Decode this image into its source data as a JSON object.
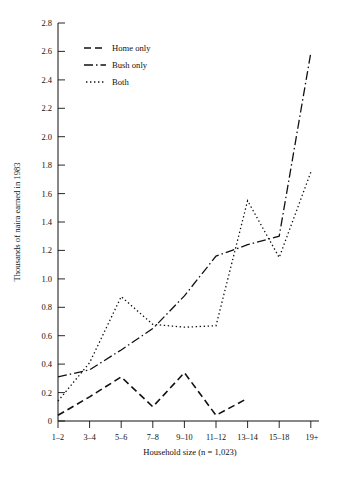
{
  "chart_data": {
    "type": "line",
    "title": "",
    "xlabel": "Household size (n = 1,023)",
    "ylabel": "Thousands of naira earned in 1983",
    "categories": [
      "1–2",
      "3–4",
      "5–6",
      "7–8",
      "9–10",
      "11–12",
      "13–14",
      "15–18",
      "19+"
    ],
    "ylim": [
      0,
      2.8
    ],
    "yticks": [
      "0",
      "0.2",
      "0.4",
      "0.6",
      "0.8",
      "1.0",
      "1.2",
      "1.4",
      "1.6",
      "1.8",
      "2.0",
      "2.2",
      "2.4",
      "2.6",
      "2.8"
    ],
    "ytick_values": [
      0,
      0.2,
      0.4,
      0.6,
      0.8,
      1.0,
      1.2,
      1.4,
      1.6,
      1.8,
      2.0,
      2.2,
      2.4,
      2.6,
      2.8
    ],
    "grid": false,
    "legend_position": "top-left-inside",
    "series": [
      {
        "name": "Home only",
        "style": "dashed",
        "dash": "7,4",
        "width": 1.6,
        "color": "#111111",
        "values": [
          0.04,
          0.17,
          0.31,
          0.1,
          0.34,
          0.04,
          0.16,
          null,
          null
        ]
      },
      {
        "name": "Bush only",
        "style": "dash-dot",
        "dash": "9,3,1.5,3",
        "width": 1.3,
        "color": "#111111",
        "values": [
          0.31,
          0.36,
          0.5,
          0.65,
          0.88,
          1.16,
          1.24,
          1.3,
          2.59
        ]
      },
      {
        "name": "Both",
        "style": "dotted",
        "dash": "1.4,2.6",
        "width": 1.3,
        "color": "#111111",
        "values": [
          0.14,
          0.41,
          0.875,
          0.68,
          0.66,
          0.67,
          1.55,
          1.15,
          1.75
        ]
      }
    ]
  },
  "legend": {
    "items": [
      {
        "label": "Home only"
      },
      {
        "label": "Bush only"
      },
      {
        "label": "Both"
      }
    ]
  },
  "axes": {
    "y_title": "Thousands of naira earned in 1983",
    "x_title": "Household size (n = 1,023)"
  },
  "colors": {
    "ink": "#111111",
    "background": "#ffffff"
  }
}
